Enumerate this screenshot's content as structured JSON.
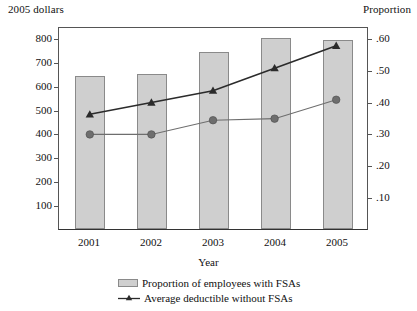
{
  "axis_captions": {
    "left": "2005 dollars",
    "right": "Proportion"
  },
  "chart_data": {
    "type": "bar",
    "title": "",
    "xlabel": "Year",
    "ylabel": "2005 dollars",
    "y2label": "Proportion",
    "categories": [
      "2001",
      "2002",
      "2003",
      "2004",
      "2005"
    ],
    "ylim": [
      0,
      850
    ],
    "y2lim": [
      0,
      0.6375
    ],
    "yticks": [
      "100",
      "200",
      "300",
      "400",
      "500",
      "600",
      "700",
      "800"
    ],
    "ytick_values": [
      100,
      200,
      300,
      400,
      500,
      600,
      700,
      800
    ],
    "y2ticks": [
      ".10",
      ".20",
      ".30",
      ".40",
      ".50",
      ".60"
    ],
    "y2tick_values": [
      0.1,
      0.2,
      0.3,
      0.4,
      0.5,
      0.6
    ],
    "grid": false,
    "legend_position": "bottom",
    "series": [
      {
        "name": "Proportion of employees with FSAs",
        "type": "bar",
        "axis": "left",
        "color": "#cfcfcf",
        "edge_color": "#8a8a8a",
        "values": [
          640,
          650,
          740,
          798,
          792
        ]
      },
      {
        "name": "Average deductible without FSAs",
        "type": "line",
        "axis": "left",
        "marker": "triangle",
        "color": "#2b2b2b",
        "values": [
          485,
          535,
          585,
          680,
          775
        ]
      },
      {
        "name": "proportion-line",
        "type": "line",
        "axis": "right",
        "marker": "circle",
        "color": "#6e6e6e",
        "values": [
          0.3,
          0.3,
          0.345,
          0.35,
          0.41
        ]
      }
    ]
  },
  "legend": {
    "items": [
      {
        "label": "Proportion of employees with FSAs",
        "marker": "bar-swatch"
      },
      {
        "label": "Average deductible without FSAs",
        "marker": "line-triangle"
      }
    ]
  }
}
